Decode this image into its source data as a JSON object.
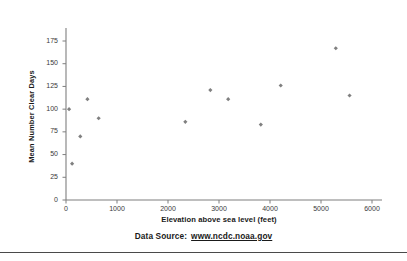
{
  "chart_data": {
    "type": "scatter",
    "title": "",
    "xlabel": "Elevation above sea level (feet)",
    "ylabel": "Mean Number Clear Days",
    "xlim": [
      0,
      6000
    ],
    "ylim": [
      0,
      175
    ],
    "xticks": [
      0,
      1000,
      2000,
      3000,
      4000,
      5000,
      6000
    ],
    "yticks": [
      0,
      25,
      50,
      75,
      100,
      125,
      150,
      175
    ],
    "xtick_labels": [
      "0",
      "1000",
      "2000",
      "3000",
      "4000",
      "5000",
      "6000"
    ],
    "ytick_labels": [
      "0",
      "25",
      "50",
      "75",
      "100",
      "125",
      "150",
      "175"
    ],
    "grid": false,
    "legend": false,
    "marker_color": "#808080",
    "axis_color": "#7f7f7f",
    "series": [
      {
        "name": "Clear days vs elevation",
        "points": [
          {
            "x": 60,
            "y": 100
          },
          {
            "x": 120,
            "y": 40
          },
          {
            "x": 280,
            "y": 70
          },
          {
            "x": 420,
            "y": 111
          },
          {
            "x": 640,
            "y": 90
          },
          {
            "x": 2340,
            "y": 86
          },
          {
            "x": 2830,
            "y": 121
          },
          {
            "x": 3180,
            "y": 111
          },
          {
            "x": 3820,
            "y": 83
          },
          {
            "x": 4210,
            "y": 126
          },
          {
            "x": 5290,
            "y": 167
          },
          {
            "x": 5560,
            "y": 115
          }
        ]
      }
    ]
  },
  "footer": {
    "label": "Data Source:",
    "url": "www.ncdc.noaa.gov"
  }
}
